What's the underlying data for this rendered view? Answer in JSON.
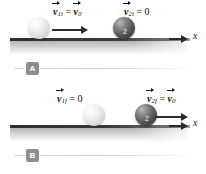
{
  "figure": {
    "type": "physics-collision-diagram",
    "axis_label": "x",
    "colors": {
      "ground": "#2e2e2e",
      "ball_light": "#e2e2e2",
      "ball_dark": "#4a4a4a",
      "badge": "#8e8e8e",
      "text": "#121212"
    }
  },
  "panels": [
    {
      "badge": "A",
      "name": "before-collision",
      "axis_label": "x",
      "labels": [
        {
          "id": "v1i",
          "lhs_symbol": "v",
          "lhs_sub": "1i",
          "operator": "=",
          "rhs_symbol": "v",
          "rhs_sub": "0",
          "rhs_is_vector": true,
          "text": "v⃗1i = v⃗0"
        },
        {
          "id": "v2i",
          "lhs_symbol": "v",
          "lhs_sub": "2i",
          "operator": "=",
          "rhs_symbol": "0",
          "rhs_sub": "",
          "rhs_is_vector": false,
          "text": "v⃗2i = 0"
        }
      ],
      "balls": [
        {
          "id": "ball-1",
          "shade": "light",
          "number": "",
          "moving": true
        },
        {
          "id": "ball-2",
          "shade": "dark",
          "number": "2",
          "moving": false
        }
      ]
    },
    {
      "badge": "B",
      "name": "after-collision",
      "axis_label": "x",
      "labels": [
        {
          "id": "v1f",
          "lhs_symbol": "v",
          "lhs_sub": "1f",
          "operator": "=",
          "rhs_symbol": "0",
          "rhs_sub": "",
          "rhs_is_vector": false,
          "text": "v⃗1f = 0"
        },
        {
          "id": "v2f",
          "lhs_symbol": "v",
          "lhs_sub": "2f",
          "operator": "=",
          "rhs_symbol": "v",
          "rhs_sub": "0",
          "rhs_is_vector": true,
          "text": "v⃗2f = v⃗0"
        }
      ],
      "balls": [
        {
          "id": "ball-1",
          "shade": "light",
          "number": "",
          "moving": false
        },
        {
          "id": "ball-2",
          "shade": "dark",
          "number": "2",
          "moving": true
        }
      ]
    }
  ]
}
